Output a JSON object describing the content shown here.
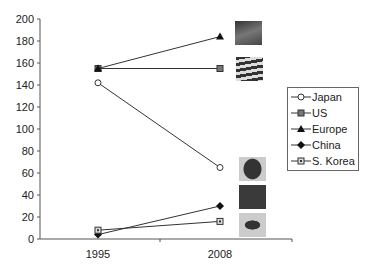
{
  "chart_data": {
    "type": "line",
    "title": "",
    "xlabel": "",
    "ylabel": "",
    "categories": [
      "1995",
      "2008"
    ],
    "ylim": [
      0,
      200
    ],
    "yticks": [
      0,
      20,
      40,
      60,
      80,
      100,
      120,
      140,
      160,
      180,
      200
    ],
    "grid": false,
    "legend_position": "right",
    "series": [
      {
        "name": "Japan",
        "marker": "open-circle",
        "values": [
          142,
          65
        ]
      },
      {
        "name": "US",
        "marker": "square",
        "values": [
          155,
          155
        ]
      },
      {
        "name": "Europe",
        "marker": "triangle",
        "values": [
          155,
          184
        ]
      },
      {
        "name": "China",
        "marker": "diamond",
        "values": [
          4,
          30
        ]
      },
      {
        "name": "S. Korea",
        "marker": "boxed-square",
        "values": [
          8,
          16
        ]
      }
    ],
    "annotations": [
      "EU flag image",
      "US flag image",
      "Japan flag image",
      "China flag image",
      "South Korea flag image"
    ]
  },
  "legend": {
    "items": [
      "Japan",
      "US",
      "Europe",
      "China",
      "S. Korea"
    ]
  },
  "axis": {
    "yticks": [
      "200",
      "180",
      "160",
      "140",
      "120",
      "100",
      "80",
      "60",
      "40",
      "20",
      "0"
    ],
    "xticks": [
      "1995",
      "2008"
    ]
  }
}
